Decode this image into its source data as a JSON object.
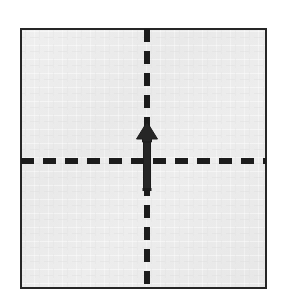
{
  "figure": {
    "title": "Origami fold step: valley fold bottom edge up to top edge",
    "type": "origami-fold-diagram",
    "canvas": {
      "width": 282,
      "height": 297,
      "background": "#ffffff"
    }
  },
  "paper": {
    "label": "square sheet of paper",
    "shape": "square",
    "x": 21,
    "y": 29,
    "width": 245,
    "height": 259,
    "fill": "#e9e9e9",
    "fill_highlight": "#f1f1f1",
    "border_color": "#262626",
    "border_width": 2
  },
  "fold_lines": [
    {
      "name": "vertical-fold-line",
      "orientation": "vertical",
      "style": "dashed",
      "meaning": "existing crease / center line",
      "x": 147,
      "y1": 29,
      "y2": 288,
      "color": "#1c1c1c",
      "thickness": 6,
      "dash": 13,
      "gap": 9
    },
    {
      "name": "horizontal-fold-line",
      "orientation": "horizontal",
      "style": "dashed",
      "meaning": "valley fold crease",
      "y": 161,
      "x1": 21,
      "x2": 266,
      "color": "#1c1c1c",
      "thickness": 6,
      "dash": 13,
      "gap": 9
    }
  ],
  "arrow": {
    "name": "fold-direction-arrow",
    "direction": "up",
    "meaning": "fold bottom edge upward",
    "tail_x": 147,
    "tail_y": 190,
    "tip_x": 147,
    "tip_y": 122,
    "shaft_width": 7,
    "head_width": 21,
    "head_height": 17,
    "color": "#262626"
  },
  "colors": {
    "paper_fill": "#e9e9e9",
    "ink": "#262626",
    "background": "#ffffff"
  }
}
